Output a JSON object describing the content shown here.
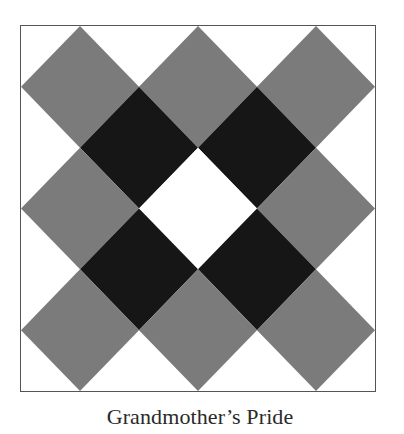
{
  "figure": {
    "caption": "Grandmother’s Pride",
    "grid_units": 6,
    "colors": {
      "background": "#ffffff",
      "gray": "#7b7b7b",
      "black": "#161616",
      "white": "#ffffff",
      "border": "#555555"
    },
    "diamonds": [
      {
        "cx": 1,
        "cy": 1,
        "fill": "gray"
      },
      {
        "cx": 3,
        "cy": 1,
        "fill": "gray"
      },
      {
        "cx": 5,
        "cy": 1,
        "fill": "gray"
      },
      {
        "cx": 2,
        "cy": 2,
        "fill": "black"
      },
      {
        "cx": 4,
        "cy": 2,
        "fill": "black"
      },
      {
        "cx": 1,
        "cy": 3,
        "fill": "gray"
      },
      {
        "cx": 3,
        "cy": 3,
        "fill": "white"
      },
      {
        "cx": 5,
        "cy": 3,
        "fill": "gray"
      },
      {
        "cx": 2,
        "cy": 4,
        "fill": "black"
      },
      {
        "cx": 4,
        "cy": 4,
        "fill": "black"
      },
      {
        "cx": 1,
        "cy": 5,
        "fill": "gray"
      },
      {
        "cx": 3,
        "cy": 5,
        "fill": "gray"
      },
      {
        "cx": 5,
        "cy": 5,
        "fill": "gray"
      }
    ]
  }
}
